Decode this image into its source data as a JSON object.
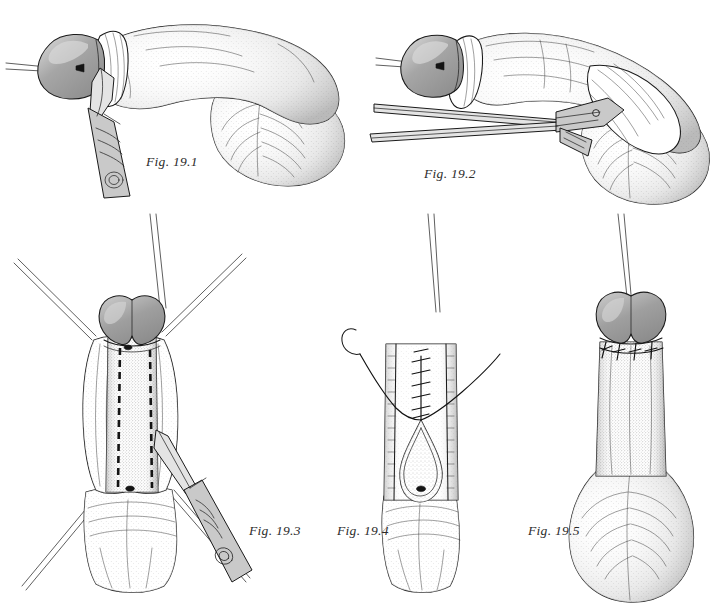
{
  "plate": {
    "title": "Surgical technique plate, Figures 19.1-19.5",
    "background_color": "#ffffff",
    "ink_color": "#1a1a1a",
    "glans_color": "#9a9a9a",
    "glans_highlight_color": "#cfcfcf",
    "instrument_color": "#c9c9c9",
    "width": 718,
    "height": 612
  },
  "figures": [
    {
      "id": "fig-19-1",
      "caption": "Fig. 19.1",
      "caption_x": 146,
      "caption_y": 166,
      "view": "lateral",
      "instrument": "scalpel",
      "description": "Lateral view with holding suture through glans; scalpel poised at coronal sulcus"
    },
    {
      "id": "fig-19-2",
      "caption": "Fig. 19.2",
      "caption_x": 424,
      "caption_y": 178,
      "view": "lateral",
      "instrument": "scissors",
      "description": "Lateral view; scissors dissecting beneath retracted skin sleeve"
    },
    {
      "id": "fig-19-3",
      "caption": "Fig. 19.3",
      "caption_x": 249,
      "caption_y": 535,
      "view": "frontal",
      "instrument": "scalpel",
      "description": "Frontal view with four retraction sutures and two dashed incision lines; scalpel incising"
    },
    {
      "id": "fig-19-4",
      "caption": "Fig. 19.4",
      "caption_x": 337,
      "caption_y": 535,
      "view": "frontal",
      "instrument": "needle-and-thread",
      "description": "Frontal view; ladder of interrupted sutures closing proximal defect, teardrop opening remains"
    },
    {
      "id": "fig-19-5",
      "caption": "Fig. 19.5",
      "caption_x": 528,
      "caption_y": 535,
      "view": "frontal",
      "instrument": "none",
      "description": "Frontal view of completed closure with circumferential subcoronal suture line"
    }
  ],
  "icons": {
    "scalpel": "scalpel-icon",
    "scissors": "scissors-icon",
    "needle": "curved-needle-icon",
    "suture_thread": "suture-thread-icon"
  }
}
